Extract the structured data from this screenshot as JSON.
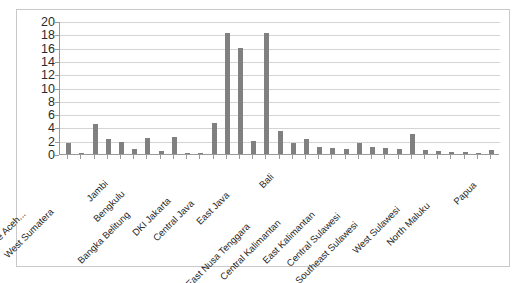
{
  "chart": {
    "title": "",
    "subtitle": "",
    "frame_border_color": "#c9c9c9",
    "bar_color": "#808080",
    "gridline_color": "#d4d4d4",
    "axis_color": "#9a9a9a"
  },
  "chart_data": {
    "type": "bar",
    "title": "",
    "xlabel": "",
    "ylabel": "",
    "ylim": [
      0,
      20
    ],
    "yticks": [
      0,
      2,
      4,
      6,
      8,
      10,
      12,
      14,
      16,
      18,
      20
    ],
    "grid": true,
    "legend": "none",
    "categories": [
      "Nangroe Aceh...",
      "North Sumatera",
      "West Sumatera",
      "Riau",
      "Jambi",
      "South Sumatera",
      "Bengkulu",
      "Lampung",
      "Bangka Belitung",
      "Riau Islands",
      "DKI Jakarta",
      "West Java",
      "Central Java",
      "DI Yogyakarta",
      "East Java",
      "Banten",
      "Bali",
      "West Nusa Tenggara",
      "East Nusa Tenggara",
      "West Kalimantan",
      "Central Kalimantan",
      "South Kalimantan",
      "East Kalimantan",
      "North Sulawesi",
      "Central Sulawesi",
      "South Sulawesi",
      "Southeast Sulawesi",
      "Gorontalo",
      "West Sulawesi",
      "Maluku",
      "North Maluku",
      "West Papua",
      "Papua"
    ],
    "values": [
      1.7,
      0.1,
      4.5,
      2.2,
      1.8,
      0.7,
      2.4,
      0.5,
      2.6,
      0.2,
      0.2,
      4.7,
      18.2,
      16.0,
      1.9,
      18.2,
      3.5,
      1.6,
      2.3,
      1.1,
      0.9,
      0.7,
      1.6,
      1.0,
      0.9,
      0.8,
      3.0,
      0.6,
      0.4,
      0.3,
      0.3,
      0.2,
      0.6
    ],
    "visible_tick_labels": [
      "Nangroe Aceh...",
      "West Sumatera",
      "Jambi",
      "Bengkulu",
      "Bangka Belitung",
      "DKI Jakarta",
      "Central Java",
      "East Java",
      "Bali",
      "East Nusa Tenggara",
      "Central Kalimantan",
      "East Kalimantan",
      "Central Sulawesi",
      "Southeast Sulawesi",
      "West Sulawesi",
      "North Maluku",
      "Papua"
    ]
  }
}
